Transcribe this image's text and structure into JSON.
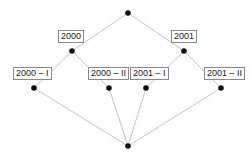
{
  "diagram": {
    "type": "concept-lattice",
    "nodes": [
      {
        "id": "top",
        "x": 128,
        "y": 13,
        "label": null
      },
      {
        "id": "y2000",
        "x": 72,
        "y": 51,
        "label": "2000"
      },
      {
        "id": "y2001",
        "x": 184,
        "y": 51,
        "label": "2001"
      },
      {
        "id": "y2000_1",
        "x": 34,
        "y": 88,
        "label": "2000 – I"
      },
      {
        "id": "y2000_2",
        "x": 109,
        "y": 88,
        "label": "2000 – II"
      },
      {
        "id": "y2001_1",
        "x": 146,
        "y": 88,
        "label": "2001 – I"
      },
      {
        "id": "y2001_2",
        "x": 221,
        "y": 88,
        "label": "2001 – II"
      },
      {
        "id": "bottom",
        "x": 128,
        "y": 146,
        "label": null
      }
    ],
    "edges": [
      [
        "top",
        "y2000"
      ],
      [
        "top",
        "y2001"
      ],
      [
        "y2000",
        "y2000_1"
      ],
      [
        "y2000",
        "y2000_2"
      ],
      [
        "y2001",
        "y2001_1"
      ],
      [
        "y2001",
        "y2001_2"
      ],
      [
        "y2000_1",
        "bottom"
      ],
      [
        "y2000_2",
        "bottom"
      ],
      [
        "y2001_1",
        "bottom"
      ],
      [
        "y2001_2",
        "bottom"
      ]
    ],
    "labels": {
      "y2000": "2000",
      "y2001": "2001",
      "y2000_1": "2000 – I",
      "y2000_2": "2000 – II",
      "y2001_1": "2001 – I",
      "y2001_2": "2001 – II"
    },
    "colors": {
      "edge": "#b4b4b4",
      "node": "#111111",
      "label_border": "#8a8a8a",
      "label_text": "#222222"
    }
  }
}
